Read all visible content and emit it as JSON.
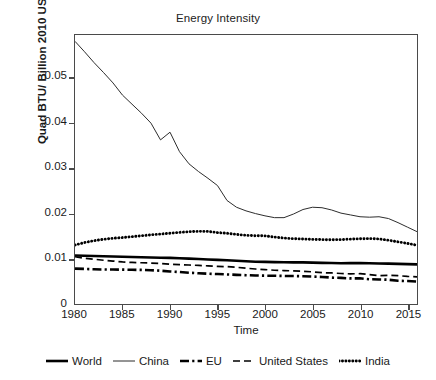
{
  "chart_data": {
    "type": "line",
    "title": "Energy Intensity",
    "xlabel": "Time",
    "ylabel": "Quad BTU/ Billion 2010 US$ GDP",
    "xlim": [
      1980,
      2016
    ],
    "ylim": [
      0,
      0.0595
    ],
    "grid": false,
    "legend_position": "bottom",
    "xticks": [
      1980,
      1985,
      1990,
      1995,
      2000,
      2005,
      2010,
      2015
    ],
    "xtick_labels": [
      "1980",
      "1985",
      "1990",
      "1995",
      "2000",
      "2005",
      "2010",
      "2015"
    ],
    "yticks": [
      0,
      0.01,
      0.02,
      0.03,
      0.04,
      0.05
    ],
    "ytick_labels": [
      "0",
      "0.01",
      "0.02",
      "0.03",
      "0.04",
      "0.05"
    ],
    "x": [
      1980,
      1981,
      1982,
      1983,
      1984,
      1985,
      1986,
      1987,
      1988,
      1989,
      1990,
      1991,
      1992,
      1993,
      1994,
      1995,
      1996,
      1997,
      1998,
      1999,
      2000,
      2001,
      2002,
      2003,
      2004,
      2005,
      2006,
      2007,
      2008,
      2009,
      2010,
      2011,
      2012,
      2013,
      2014,
      2015,
      2016
    ],
    "series": [
      {
        "name": "World",
        "style": "solid",
        "width": 2.6,
        "color": "#000000",
        "values": [
          0.01072,
          0.01068,
          0.01063,
          0.01058,
          0.01052,
          0.01046,
          0.0104,
          0.01034,
          0.01029,
          0.01024,
          0.0102,
          0.01013,
          0.01004,
          0.00996,
          0.00986,
          0.00976,
          0.00966,
          0.00956,
          0.00944,
          0.00936,
          0.00932,
          0.00927,
          0.00922,
          0.00921,
          0.0092,
          0.00916,
          0.0091,
          0.00905,
          0.00901,
          0.00904,
          0.00906,
          0.00901,
          0.00897,
          0.00893,
          0.00888,
          0.00882,
          0.00877
        ]
      },
      {
        "name": "China",
        "style": "solid",
        "width": 1.0,
        "color": "#2b2b2b",
        "values": [
          0.0581,
          0.0558,
          0.0534,
          0.0512,
          0.0489,
          0.0462,
          0.0442,
          0.0422,
          0.04,
          0.0363,
          0.038,
          0.0337,
          0.031,
          0.0293,
          0.0278,
          0.0262,
          0.0229,
          0.0214,
          0.0206,
          0.02,
          0.0195,
          0.0191,
          0.0191,
          0.0199,
          0.0209,
          0.0214,
          0.0213,
          0.0208,
          0.0201,
          0.0197,
          0.0193,
          0.0192,
          0.0193,
          0.0189,
          0.018,
          0.017,
          0.016
        ]
      },
      {
        "name": "EU",
        "style": "dashdot",
        "width": 2.6,
        "color": "#000000",
        "values": [
          0.00783,
          0.00776,
          0.00768,
          0.00764,
          0.00762,
          0.0076,
          0.00757,
          0.00754,
          0.00748,
          0.00736,
          0.0072,
          0.00707,
          0.00692,
          0.0068,
          0.0067,
          0.00662,
          0.00654,
          0.00645,
          0.00637,
          0.0063,
          0.00627,
          0.00625,
          0.0062,
          0.00618,
          0.00615,
          0.00608,
          0.00598,
          0.00584,
          0.00577,
          0.00566,
          0.00568,
          0.00548,
          0.00543,
          0.00537,
          0.00514,
          0.00507,
          0.00498
        ]
      },
      {
        "name": "United States",
        "style": "dashed",
        "width": 1.7,
        "color": "#000000",
        "values": [
          0.01045,
          0.0101,
          0.0099,
          0.00968,
          0.0095,
          0.0093,
          0.0092,
          0.00912,
          0.00905,
          0.00898,
          0.0088,
          0.00872,
          0.00862,
          0.00854,
          0.00843,
          0.00833,
          0.00826,
          0.00812,
          0.00792,
          0.00774,
          0.00762,
          0.00746,
          0.0074,
          0.00732,
          0.00724,
          0.00712,
          0.00693,
          0.00687,
          0.00674,
          0.00668,
          0.0067,
          0.00651,
          0.00628,
          0.00634,
          0.00626,
          0.0061,
          0.006
        ]
      },
      {
        "name": "India",
        "style": "dotted",
        "width": 2.9,
        "color": "#000000",
        "values": [
          0.01305,
          0.0136,
          0.014,
          0.01432,
          0.01455,
          0.0147,
          0.0149,
          0.0151,
          0.0153,
          0.01548,
          0.01565,
          0.01585,
          0.016,
          0.01608,
          0.01605,
          0.0158,
          0.01565,
          0.0154,
          0.0152,
          0.0151,
          0.01508,
          0.0148,
          0.0146,
          0.01445,
          0.01438,
          0.0143,
          0.01424,
          0.0142,
          0.01425,
          0.01435,
          0.01442,
          0.01448,
          0.0144,
          0.0141,
          0.01375,
          0.0134,
          0.013
        ]
      }
    ]
  },
  "legend": {
    "items": [
      {
        "label": "World",
        "swatch": "legend-swatch-solid-thick"
      },
      {
        "label": "China",
        "swatch": "legend-swatch-solid-thin"
      },
      {
        "label": "EU",
        "swatch": "legend-swatch-dashdot"
      },
      {
        "label": "United States",
        "swatch": "legend-swatch-dashed"
      },
      {
        "label": "India",
        "swatch": "legend-swatch-dotted"
      }
    ]
  }
}
